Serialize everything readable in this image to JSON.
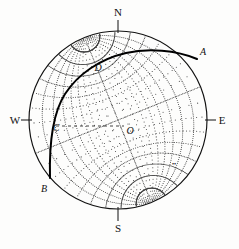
{
  "figure": {
    "type": "stereographic-projection",
    "background_color": "#fdfdfc",
    "ink_color": "#111111",
    "grid_color": "#3a3a3a",
    "bold_color": "#000000"
  },
  "primitive_circle": {
    "center_x": 118,
    "center_y": 120,
    "radius": 89,
    "stroke_width": 1.15
  },
  "grid": {
    "kind": "wulff",
    "interval_degrees": 10,
    "style": "dotted",
    "dot_radius": 0.52,
    "dot_spacing_degrees": 1.25,
    "great_circle_dips": [
      10,
      20,
      30,
      40,
      50,
      60,
      70,
      80
    ],
    "small_circle_angles": [
      10,
      20,
      30,
      40,
      50,
      60,
      70,
      80
    ],
    "tilt_degrees": -22
  },
  "cardinal_labels": [
    {
      "name": "north",
      "text": "N",
      "x": 118,
      "y": 12,
      "tick": {
        "x1": 118,
        "y1": 20,
        "x2": 118,
        "y2": 33
      }
    },
    {
      "name": "south",
      "text": "S",
      "x": 118,
      "y": 228,
      "tick": {
        "x1": 118,
        "y1": 207,
        "x2": 118,
        "y2": 221
      }
    },
    {
      "name": "east",
      "text": "E",
      "x": 222,
      "y": 120,
      "tick": {
        "x1": 205,
        "y1": 120,
        "x2": 216,
        "y2": 120
      }
    },
    {
      "name": "west",
      "text": "W",
      "x": 15,
      "y": 120,
      "tick": {
        "x1": 21,
        "y1": 120,
        "x2": 32,
        "y2": 120
      }
    }
  ],
  "point_labels": [
    {
      "name": "point-a",
      "text": "A",
      "x": 203,
      "y": 52
    },
    {
      "name": "point-b",
      "text": "B",
      "x": 44,
      "y": 189
    },
    {
      "name": "point-c",
      "text": "C",
      "x": 56,
      "y": 128
    },
    {
      "name": "point-d",
      "text": "D",
      "x": 98,
      "y": 68
    },
    {
      "name": "point-o",
      "text": "O",
      "x": 130,
      "y": 131
    }
  ],
  "bold_trace": {
    "name": "great-circle-ABD",
    "stroke_width": 2.0,
    "path": "M 197 59 C 176 50 148 48 126 53 C 100 59 78 74 65 94 C 54 111 49 139 50 178"
  },
  "dashed_line": {
    "name": "chord-C-to-O",
    "x1": 56,
    "y1": 126,
    "x2": 124,
    "y2": 126,
    "dash": "3 3",
    "stroke_width": 0.8
  },
  "extra_mark": {
    "name": "lower-right-tick",
    "x": 172,
    "y": 166,
    "text": "••"
  }
}
